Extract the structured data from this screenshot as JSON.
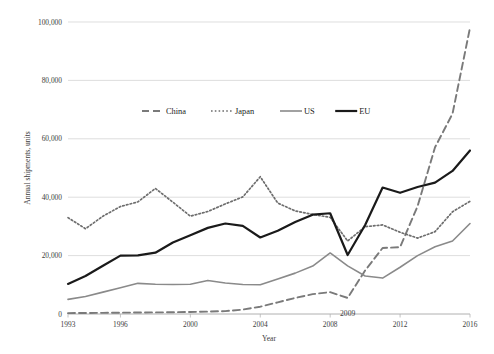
{
  "chart_data": {
    "type": "line",
    "title": "",
    "xlabel": "Year",
    "ylabel": "Annual shipments, units",
    "xlim": [
      1993,
      2016
    ],
    "ylim": [
      0,
      100000
    ],
    "xticks": [
      1993,
      1996,
      2000,
      2004,
      2008,
      2012,
      2016
    ],
    "xtick_labels": [
      "1993",
      "1996",
      "2000",
      "2004",
      "2008",
      "2012",
      "2016"
    ],
    "yticks": [
      0,
      20000,
      40000,
      60000,
      80000,
      100000
    ],
    "ytick_labels": [
      "0",
      "20,000",
      "40,000",
      "60,000",
      "80,000",
      "100,000"
    ],
    "grid": true,
    "legend_position": "upper-center",
    "x": [
      1993,
      1994,
      1995,
      1996,
      1997,
      1998,
      1999,
      2000,
      2001,
      2002,
      2003,
      2004,
      2005,
      2006,
      2007,
      2008,
      2009,
      2010,
      2011,
      2012,
      2013,
      2014,
      2015,
      2016
    ],
    "series": [
      {
        "name": "China",
        "style": "dashed",
        "color": "#7a7a7a",
        "values": [
          300,
          350,
          400,
          450,
          500,
          550,
          600,
          700,
          800,
          1000,
          1500,
          2500,
          4000,
          5500,
          6800,
          7500,
          5500,
          14900,
          22600,
          22900,
          36900,
          57100,
          68600,
          98000
        ]
      },
      {
        "name": "Japan",
        "style": "dotted",
        "color": "#6e6e6e",
        "values": [
          33000,
          29200,
          33500,
          36800,
          38400,
          43000,
          38300,
          33500,
          35100,
          37700,
          40100,
          47000,
          38000,
          35300,
          34100,
          33100,
          25000,
          29900,
          30500,
          28000,
          26000,
          28200,
          35000,
          38600
        ]
      },
      {
        "name": "US",
        "style": "solid-thin",
        "color": "#8a8a8a",
        "values": [
          5000,
          6000,
          7500,
          9000,
          10500,
          10200,
          10100,
          10200,
          11500,
          10600,
          10100,
          10000,
          12000,
          14000,
          16400,
          20900,
          16500,
          13000,
          12300,
          16000,
          20000,
          23000,
          25000,
          31000
        ]
      },
      {
        "name": "EU",
        "style": "solid-thick",
        "color": "#1a1a1a",
        "values": [
          10300,
          13000,
          16500,
          20000,
          20100,
          21000,
          24500,
          27000,
          29500,
          31000,
          30200,
          26200,
          28500,
          31500,
          34000,
          34500,
          20200,
          30500,
          43300,
          41500,
          43500,
          45000,
          49000,
          56000
        ]
      }
    ],
    "annotations": [
      {
        "text": "2009",
        "x": 2009,
        "y": 2000,
        "name": "crisis-year-annotation"
      }
    ]
  },
  "legend": {
    "items": [
      {
        "label": "China",
        "name": "legend-item-china"
      },
      {
        "label": "Japan",
        "name": "legend-item-japan"
      },
      {
        "label": "US",
        "name": "legend-item-us"
      },
      {
        "label": "EU",
        "name": "legend-item-eu"
      }
    ]
  }
}
